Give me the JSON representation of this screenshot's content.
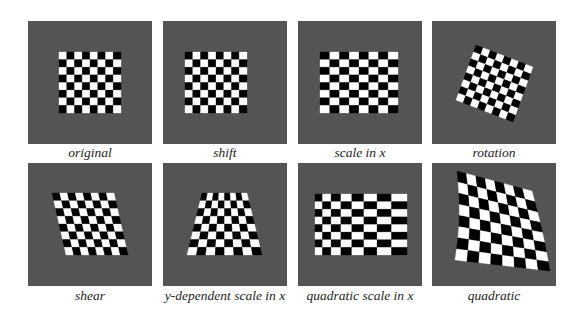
{
  "figure": {
    "background_color": "#ffffff",
    "panel_color": "#545454",
    "board": {
      "rows": 8,
      "cols": 8,
      "dark": "#000000",
      "light": "#ffffff"
    },
    "panels": [
      {
        "id": "original",
        "caption": "original",
        "transform": "identity",
        "x": 28,
        "y": 21
      },
      {
        "id": "shift",
        "caption": "shift",
        "transform": "translation",
        "x": 163,
        "y": 21
      },
      {
        "id": "scale-x",
        "caption": "scale in x",
        "transform": "scale_x",
        "x": 298,
        "y": 21
      },
      {
        "id": "rotation",
        "caption": "rotation",
        "transform": "rotation",
        "x": 432,
        "y": 21
      },
      {
        "id": "shear",
        "caption": "shear",
        "transform": "shear",
        "x": 28,
        "y": 163
      },
      {
        "id": "y-dependent-scale",
        "caption": "y-dependent scale in x",
        "transform": "y_dependent_scale_x",
        "x": 163,
        "y": 163
      },
      {
        "id": "quadratic-scale-x",
        "caption": "quadratic scale in x",
        "transform": "quadratic_scale_x",
        "x": 298,
        "y": 163
      },
      {
        "id": "quadratic",
        "caption": "quadratic",
        "transform": "quadratic",
        "x": 432,
        "y": 163
      }
    ]
  }
}
